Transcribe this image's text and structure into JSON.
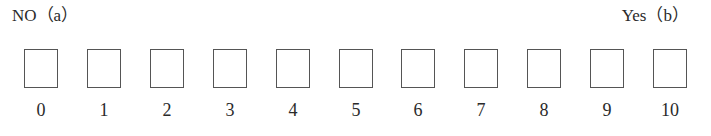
{
  "scale": {
    "left_label": "NO（a）",
    "right_label": "Yes（b）",
    "options": [
      {
        "value": "0",
        "x": 41
      },
      {
        "value": "1",
        "x": 104
      },
      {
        "value": "2",
        "x": 167
      },
      {
        "value": "3",
        "x": 230
      },
      {
        "value": "4",
        "x": 293
      },
      {
        "value": "5",
        "x": 356
      },
      {
        "value": "6",
        "x": 418
      },
      {
        "value": "7",
        "x": 481
      },
      {
        "value": "8",
        "x": 544
      },
      {
        "value": "9",
        "x": 607
      },
      {
        "value": "10",
        "x": 670
      }
    ]
  }
}
